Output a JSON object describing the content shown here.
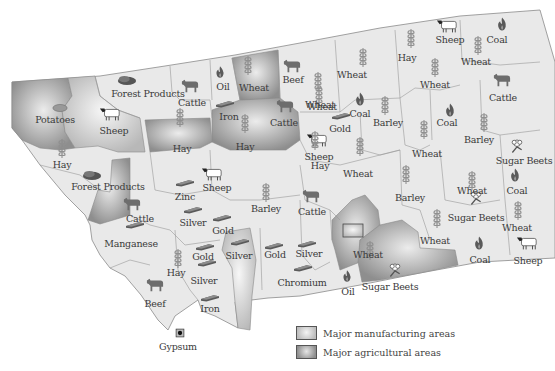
{
  "map": {
    "title": "Montana natural resources and products",
    "colors": {
      "base": "#e9e9e9",
      "border": "#8a8a8a",
      "manufacturing": "#c4c4c4",
      "agricultural": "#9c9c9c",
      "label": "#3a3a3a"
    },
    "labels": [
      {
        "text": "Forest Products",
        "icon": "log-icon",
        "region": "northwest"
      },
      {
        "text": "Cattle",
        "icon": "cattle-icon",
        "region": "north-central-west"
      },
      {
        "text": "Oil",
        "icon": "oil-drop-icon",
        "region": "north-central"
      },
      {
        "text": "Wheat",
        "icon": "wheat-icon",
        "region": "north-central"
      },
      {
        "text": "Beef",
        "icon": "cattle-icon",
        "region": "north-central"
      },
      {
        "text": "Hay",
        "icon": "wheat-icon",
        "region": "northeast"
      },
      {
        "text": "Sheep",
        "icon": "sheep-icon",
        "region": "northeast"
      },
      {
        "text": "Coal",
        "icon": "coal-flame-icon",
        "region": "northeast"
      },
      {
        "text": "Wheat",
        "icon": "wheat-icon",
        "region": "northeast"
      },
      {
        "text": "Wheat",
        "icon": "wheat-icon",
        "region": "north-central"
      },
      {
        "text": "Wheat",
        "icon": "wheat-icon",
        "region": "north-central-east"
      },
      {
        "text": "Wheat",
        "icon": "wheat-icon",
        "region": "northeast"
      },
      {
        "text": "Cattle",
        "icon": "cattle-icon",
        "region": "northeast"
      },
      {
        "text": "Potatoes",
        "icon": "potato-icon",
        "region": "northwest"
      },
      {
        "text": "Sheep",
        "icon": "sheep-icon",
        "region": "northwest"
      },
      {
        "text": "Iron",
        "icon": "ingot-icon",
        "region": "north-central"
      },
      {
        "text": "Cattle",
        "icon": "cattle-icon",
        "region": "central"
      },
      {
        "text": "Wheat",
        "icon": "wheat-icon",
        "region": "central"
      },
      {
        "text": "Coal",
        "icon": "coal-flame-icon",
        "region": "central"
      },
      {
        "text": "Gold",
        "icon": "ingot-icon",
        "region": "central"
      },
      {
        "text": "Barley",
        "icon": "wheat-icon",
        "region": "central-east"
      },
      {
        "text": "Coal",
        "icon": "coal-flame-icon",
        "region": "east"
      },
      {
        "text": "Barley",
        "icon": "wheat-icon",
        "region": "east"
      },
      {
        "text": "Sugar Beets",
        "icon": "sugar-beet-icon",
        "region": "east"
      },
      {
        "text": "Hay",
        "icon": "wheat-icon",
        "region": "west"
      },
      {
        "text": "Hay",
        "icon": "wheat-icon",
        "region": "west-central"
      },
      {
        "text": "Hay",
        "icon": "wheat-icon",
        "region": "central"
      },
      {
        "text": "Sheep",
        "icon": "sheep-icon",
        "region": "central-east"
      },
      {
        "text": "Wheat",
        "icon": "wheat-icon",
        "region": "central-east"
      },
      {
        "text": "Hay",
        "icon": "wheat-icon",
        "region": "central"
      },
      {
        "text": "Wheat",
        "icon": "wheat-icon",
        "region": "central"
      },
      {
        "text": "Forest Products",
        "icon": "log-icon",
        "region": "west"
      },
      {
        "text": "Zinc",
        "icon": "ingot-icon",
        "region": "west-central"
      },
      {
        "text": "Sheep",
        "icon": "sheep-icon",
        "region": "west-central"
      },
      {
        "text": "Cattle",
        "icon": "cattle-icon",
        "region": "west"
      },
      {
        "text": "Barley",
        "icon": "wheat-icon",
        "region": "central"
      },
      {
        "text": "Cattle",
        "icon": "cattle-icon",
        "region": "central"
      },
      {
        "text": "Barley",
        "icon": "wheat-icon",
        "region": "east-central"
      },
      {
        "text": "Wheat",
        "icon": "wheat-icon",
        "region": "east"
      },
      {
        "text": "Coal",
        "icon": "coal-flame-icon",
        "region": "far-east"
      },
      {
        "text": "Silver",
        "icon": "ingot-icon",
        "region": "west-central"
      },
      {
        "text": "Gold",
        "icon": "ingot-icon",
        "region": "west-central"
      },
      {
        "text": "Sugar Beets",
        "icon": "sugar-beet-icon",
        "region": "east"
      },
      {
        "text": "Wheat",
        "icon": "wheat-icon",
        "region": "far-east"
      },
      {
        "text": "Manganese",
        "icon": "ingot-icon",
        "region": "southwest"
      },
      {
        "text": "Gold",
        "icon": "ingot-icon",
        "region": "southwest"
      },
      {
        "text": "Silver",
        "icon": "ingot-icon",
        "region": "south-central"
      },
      {
        "text": "Gold",
        "icon": "ingot-icon",
        "region": "south-central"
      },
      {
        "text": "Silver",
        "icon": "ingot-icon",
        "region": "south-central"
      },
      {
        "text": "Wheat",
        "icon": "wheat-icon",
        "region": "southeast"
      },
      {
        "text": "Wheat",
        "icon": "wheat-icon",
        "region": "southeast"
      },
      {
        "text": "Coal",
        "icon": "coal-flame-icon",
        "region": "southeast"
      },
      {
        "text": "Sheep",
        "icon": "sheep-icon",
        "region": "far-southeast"
      },
      {
        "text": "Hay",
        "icon": "wheat-icon",
        "region": "southwest"
      },
      {
        "text": "Silver",
        "icon": "ingot-icon",
        "region": "southwest"
      },
      {
        "text": "Chromium",
        "icon": "ingot-icon",
        "region": "south-central"
      },
      {
        "text": "Oil",
        "icon": "oil-drop-icon",
        "region": "south-central"
      },
      {
        "text": "Sugar Beets",
        "icon": "sugar-beet-icon",
        "region": "south"
      },
      {
        "text": "Beef",
        "icon": "cattle-icon",
        "region": "southwest"
      },
      {
        "text": "Iron",
        "icon": "ingot-icon",
        "region": "southwest"
      },
      {
        "text": "Gypsum",
        "icon": "gypsum-icon",
        "region": "southwest"
      }
    ]
  },
  "legend": {
    "items": [
      {
        "label": "Major manufacturing areas",
        "type": "manufacturing"
      },
      {
        "label": "Major agricultural areas",
        "type": "agricultural"
      }
    ]
  }
}
